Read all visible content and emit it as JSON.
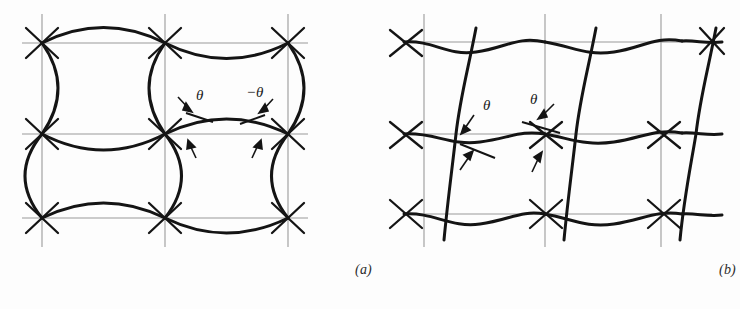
{
  "figure": {
    "background_color": "#fdfdfd",
    "grid_color": "#9a9a9a",
    "curve_color": "#141414",
    "label_color": "#1a1a1a",
    "panels": [
      {
        "id": "a",
        "caption": "(a)",
        "description": "Square reference grid with curved deformed network; arcs alternately bulge outward and inward producing equal and opposite angles at the nodes",
        "deformation_type": "pure shear",
        "grid": {
          "x_nodes": [
            42,
            165,
            288
          ],
          "y_nodes": [
            43,
            134,
            218
          ],
          "x_extent": [
            22,
            308
          ],
          "y_extent": [
            14,
            247
          ]
        },
        "angle_labels": [
          {
            "text": "θ",
            "x": 196,
            "y": 96
          },
          {
            "text": "−θ",
            "x": 253,
            "y": 93
          }
        ],
        "angle_values": [
          "θ",
          "−θ"
        ]
      },
      {
        "id": "b",
        "caption": "(b)",
        "description": "Square reference grid with slanted wavy deformed network; all nodes show the same sense of angle",
        "deformation_type": "simple shear",
        "grid": {
          "x_nodes": [
            424,
            545,
            661
          ],
          "y_nodes": [
            42,
            134,
            214
          ],
          "x_extent": [
            404,
            712
          ],
          "y_extent": [
            14,
            247
          ]
        },
        "angle_labels": [
          {
            "text": "θ",
            "x": 483,
            "y": 106
          },
          {
            "text": "θ",
            "x": 530,
            "y": 100
          }
        ],
        "angle_values": [
          "θ",
          "θ"
        ]
      }
    ]
  }
}
